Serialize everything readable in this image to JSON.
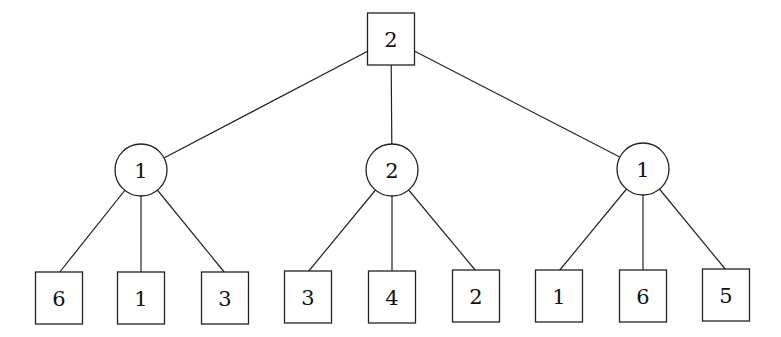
{
  "diagram": {
    "type": "game-tree",
    "root": {
      "id": "root",
      "shape": "square",
      "label": "2",
      "x": 391,
      "y": 39,
      "w": 47,
      "h": 52
    },
    "middle": [
      {
        "id": "m1",
        "shape": "circle",
        "label": "1",
        "cx": 141,
        "cy": 170,
        "r": 26
      },
      {
        "id": "m2",
        "shape": "circle",
        "label": "2",
        "cx": 392,
        "cy": 170,
        "r": 26
      },
      {
        "id": "m3",
        "shape": "circle",
        "label": "1",
        "cx": 643,
        "cy": 169,
        "r": 26
      }
    ],
    "leaves": [
      {
        "id": "l1",
        "parent": "m1",
        "shape": "square",
        "label": "6",
        "x": 59,
        "y": 298,
        "w": 47,
        "h": 52
      },
      {
        "id": "l2",
        "parent": "m1",
        "shape": "square",
        "label": "1",
        "x": 141,
        "y": 298,
        "w": 47,
        "h": 52
      },
      {
        "id": "l3",
        "parent": "m1",
        "shape": "square",
        "label": "3",
        "x": 225,
        "y": 298,
        "w": 47,
        "h": 52
      },
      {
        "id": "l4",
        "parent": "m2",
        "shape": "square",
        "label": "3",
        "x": 308,
        "y": 297,
        "w": 47,
        "h": 52
      },
      {
        "id": "l5",
        "parent": "m2",
        "shape": "square",
        "label": "4",
        "x": 392,
        "y": 297,
        "w": 47,
        "h": 52
      },
      {
        "id": "l6",
        "parent": "m2",
        "shape": "square",
        "label": "2",
        "x": 476,
        "y": 296,
        "w": 47,
        "h": 52
      },
      {
        "id": "l7",
        "parent": "m3",
        "shape": "square",
        "label": "1",
        "x": 559,
        "y": 296,
        "w": 47,
        "h": 52
      },
      {
        "id": "l8",
        "parent": "m3",
        "shape": "square",
        "label": "6",
        "x": 643,
        "y": 296,
        "w": 47,
        "h": 52
      },
      {
        "id": "l9",
        "parent": "m3",
        "shape": "square",
        "label": "5",
        "x": 726,
        "y": 295,
        "w": 47,
        "h": 52
      }
    ]
  }
}
